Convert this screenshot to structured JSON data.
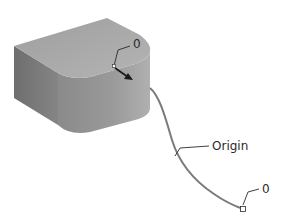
{
  "diagram": {
    "type": "3D CAD sweep path illustration",
    "labels": {
      "start_point": "0",
      "curve": "Origin",
      "end_point": "0"
    },
    "colors": {
      "solid_top": "#a8a8a8",
      "solid_side": "#8a8a8a",
      "solid_front": "#9a9a9a",
      "curve": "#7a7a7a",
      "leader": "#2a2a2a",
      "background": "#ffffff"
    }
  }
}
